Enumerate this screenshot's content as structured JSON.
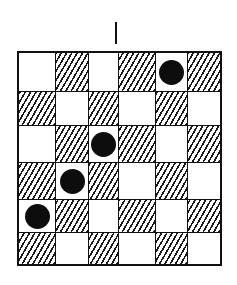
{
  "diagram": {
    "type": "checkerboard-puzzle",
    "rows": 6,
    "cols": 6,
    "colors": {
      "line": "#111111",
      "light_square": "#ffffff",
      "hatch": "#1a1a1a",
      "piece": "#0d0d0d"
    },
    "top_marker": {
      "shape": "vertical-bar",
      "column_position": "between-col-2-and-3"
    },
    "squares": [
      [
        "white",
        "hatched",
        "white",
        "hatched",
        "white",
        "hatched"
      ],
      [
        "hatched",
        "white",
        "hatched",
        "white",
        "hatched",
        "white"
      ],
      [
        "white",
        "hatched",
        "white",
        "hatched",
        "white",
        "hatched"
      ],
      [
        "hatched",
        "white",
        "hatched",
        "white",
        "hatched",
        "white"
      ],
      [
        "white",
        "hatched",
        "white",
        "hatched",
        "white",
        "hatched"
      ],
      [
        "hatched",
        "white",
        "hatched",
        "white",
        "hatched",
        "white"
      ]
    ],
    "pieces": [
      {
        "row": 0,
        "col": 4,
        "color": "black"
      },
      {
        "row": 2,
        "col": 2,
        "color": "black"
      },
      {
        "row": 3,
        "col": 1,
        "color": "black"
      },
      {
        "row": 4,
        "col": 0,
        "color": "black"
      }
    ]
  }
}
